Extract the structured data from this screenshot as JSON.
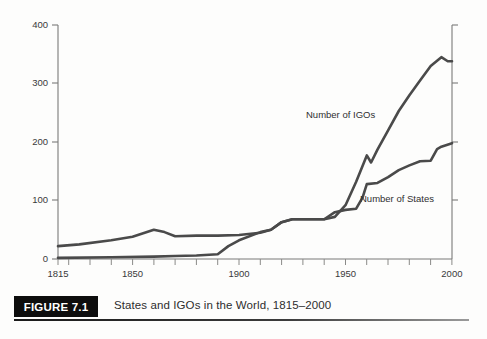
{
  "figure": {
    "tag": "FIGURE 7.1",
    "caption": "States and IGOs in the World, 1815–2000"
  },
  "annotations": {
    "igos_label": "Number of IGOs",
    "states_label": "Number of States"
  },
  "chart_data": {
    "type": "line",
    "title": "States and IGOs in the World, 1815–2000",
    "xlabel": "",
    "ylabel": "",
    "xlim": [
      1815,
      2000
    ],
    "ylim": [
      0,
      400
    ],
    "grid": false,
    "legend": "inline annotations",
    "xticks": [
      1815,
      1850,
      1900,
      1950,
      2000
    ],
    "xtick_labels": [
      "1815",
      "1850",
      "1900",
      "1950",
      "2000"
    ],
    "xticks_minor_step": 10,
    "yticks": [
      0,
      100,
      200,
      300,
      400
    ],
    "ytick_labels": [
      "0",
      "100",
      "200",
      "300",
      "400"
    ],
    "line_color": "#4a4a4a",
    "series": [
      {
        "name": "Number of IGOs",
        "x": [
          1815,
          1825,
          1840,
          1850,
          1860,
          1865,
          1870,
          1880,
          1890,
          1900,
          1910,
          1915,
          1920,
          1925,
          1930,
          1940,
          1945,
          1950,
          1955,
          1960,
          1962,
          1965,
          1970,
          1975,
          1980,
          1985,
          1990,
          1995,
          1998,
          2000
        ],
        "values": [
          22,
          25,
          32,
          38,
          50,
          46,
          39,
          40,
          40,
          41,
          45,
          50,
          63,
          68,
          68,
          68,
          72,
          92,
          132,
          177,
          165,
          187,
          220,
          253,
          280,
          305,
          330,
          345,
          338,
          338
        ]
      },
      {
        "name": "Number of States",
        "x": [
          1815,
          1840,
          1860,
          1870,
          1880,
          1890,
          1895,
          1900,
          1910,
          1915,
          1920,
          1925,
          1930,
          1940,
          1945,
          1950,
          1955,
          1958,
          1960,
          1965,
          1970,
          1975,
          1980,
          1985,
          1990,
          1993,
          1995,
          2000
        ],
        "values": [
          2,
          3,
          4,
          5,
          6,
          8,
          22,
          32,
          46,
          50,
          63,
          68,
          68,
          68,
          80,
          84,
          86,
          105,
          128,
          130,
          140,
          152,
          160,
          167,
          168,
          188,
          192,
          198
        ]
      }
    ]
  }
}
